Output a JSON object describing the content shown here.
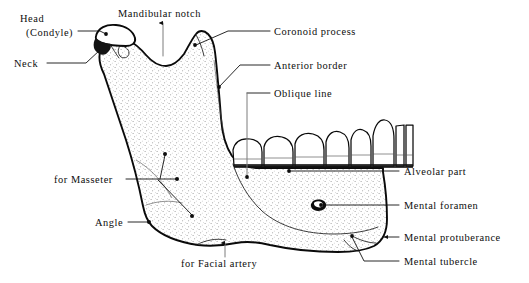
{
  "figure": {
    "colors": {
      "background": "#ffffff",
      "ink": "#0d0d0d",
      "leader": "#101010",
      "leader_grey": "#7d7d7d",
      "stipple": "#9a9a9a"
    }
  },
  "labels": {
    "head": "Head",
    "condyle": "(Condyle)",
    "neck": "Neck",
    "mandibular_notch": "Mandibular notch",
    "coronoid_process": "Coronoid process",
    "anterior_border": "Anterior border",
    "oblique_line": "Oblique line",
    "alveolar_part": "Alveolar part",
    "mental_foramen": "Mental foramen",
    "mental_protuberance": "Mental protuberance",
    "mental_tubercle": "Mental tubercle",
    "for_masseter": "for Masseter",
    "angle": "Angle",
    "for_facial_artery": "for Facial artery"
  },
  "callouts": [
    {
      "name": "head-condyle",
      "label": "Head\n(Condyle)",
      "side": "left",
      "text_xy": [
        20,
        22
      ],
      "target_xy": [
        104,
        36
      ]
    },
    {
      "name": "neck",
      "label": "Neck",
      "side": "left",
      "text_xy": [
        14,
        66
      ],
      "target_xy": [
        96,
        55
      ]
    },
    {
      "name": "mandibular-notch",
      "label": "Mandibular notch",
      "side": "top",
      "text_xy": [
        118,
        16
      ],
      "target_xy": [
        163,
        57
      ]
    },
    {
      "name": "coronoid-process",
      "label": "Coronoid process",
      "side": "right",
      "text_xy": [
        274,
        33
      ],
      "target_xy": [
        196,
        43
      ]
    },
    {
      "name": "anterior-border",
      "label": "Anterior border",
      "side": "right",
      "text_xy": [
        274,
        68
      ],
      "target_xy": [
        218,
        85
      ]
    },
    {
      "name": "oblique-line",
      "label": "Oblique line",
      "side": "right",
      "text_xy": [
        274,
        96
      ],
      "target_xy": [
        246,
        176
      ]
    },
    {
      "name": "alveolar-part",
      "label": "Alveolar part",
      "side": "right",
      "text_xy": [
        403,
        174
      ],
      "target_xy": [
        345,
        171
      ]
    },
    {
      "name": "mental-foramen",
      "label": "Mental foramen",
      "side": "right",
      "text_xy": [
        403,
        208
      ],
      "target_xy": [
        325,
        205
      ]
    },
    {
      "name": "mental-protuberance",
      "label": "Mental protuberance",
      "side": "right",
      "text_xy": [
        403,
        240
      ],
      "target_xy": [
        382,
        239
      ]
    },
    {
      "name": "mental-tubercle",
      "label": "Mental tubercle",
      "side": "right",
      "text_xy": [
        403,
        264
      ],
      "target_xy": [
        350,
        234
      ]
    },
    {
      "name": "for-masseter",
      "label": "for Masseter",
      "side": "left",
      "text_xy": [
        54,
        182
      ],
      "target_xy": [
        176,
        180
      ]
    },
    {
      "name": "angle",
      "label": "Angle",
      "side": "left",
      "text_xy": [
        95,
        224
      ],
      "target_xy": [
        146,
        222
      ]
    },
    {
      "name": "for-facial-artery",
      "label": "for Facial artery",
      "side": "bottom",
      "text_xy": [
        181,
        265
      ],
      "target_xy": [
        225,
        243
      ]
    }
  ],
  "anatomy_points": {
    "masseter_dots": [
      [
        165,
        154
      ],
      [
        177,
        180
      ],
      [
        192,
        215
      ]
    ],
    "mental_foramen_dot": [
      319,
      206
    ],
    "alveolar_dot": [
      288,
      171
    ],
    "coronoid_dot": [
      194,
      45
    ],
    "anterior_border_dot": [
      219,
      87
    ],
    "oblique_line_dot": [
      247,
      177
    ],
    "angle_dot": [
      150,
      222
    ],
    "head_dot": [
      106,
      34
    ],
    "mental_tubercle_dot": [
      352,
      236
    ]
  }
}
